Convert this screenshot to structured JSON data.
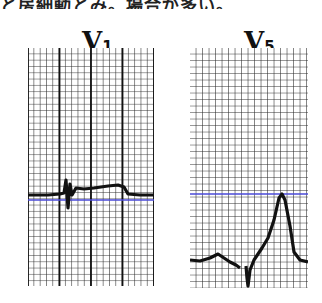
{
  "header": {
    "caption_fragment": "と房細動とみ。場合が多い。"
  },
  "leads": [
    {
      "id": "V1",
      "letter": "V",
      "subscript": "1"
    },
    {
      "id": "V5",
      "letter": "V",
      "subscript": "5"
    }
  ],
  "colors": {
    "grid": "#1a1a1a",
    "trace": "#111111",
    "reference_line": "#4a4ad8",
    "background": "#ffffff"
  }
}
